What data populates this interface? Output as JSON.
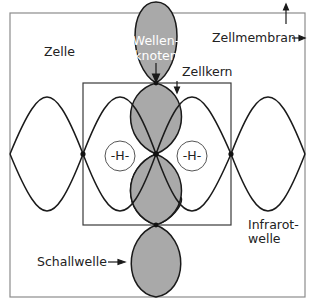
{
  "diagram": {
    "labels": {
      "cell": "Zelle",
      "cell_membrane": "Zellmembran",
      "nucleus": "Zellkern",
      "wave_node_line1": "Wellen-",
      "wave_node_line2": "knoten",
      "hydrogen_left": "-H-",
      "hydrogen_right": "-H-",
      "sound_wave": "Schallwelle",
      "infrared_line1": "Infrarot-",
      "infrared_line2": "welle"
    },
    "colors": {
      "lobe_fill": "#a9a9a9",
      "line": "#1a1a1a",
      "frame": "#8c8c8c",
      "background": "#ffffff"
    }
  }
}
